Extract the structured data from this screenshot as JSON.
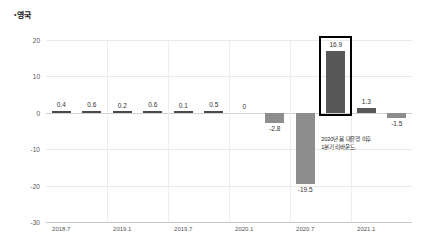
{
  "title": {
    "bullet": "•",
    "text": "영국"
  },
  "chart_data": {
    "type": "bar",
    "title": "영국",
    "xlabel": "",
    "ylabel": "",
    "ylim": [
      -30,
      20
    ],
    "grid": true,
    "legend": null,
    "categories": [
      "2018.7",
      "2018.10",
      "2019.1",
      "2019.4",
      "2019.7",
      "2019.10",
      "2020.1",
      "2020.4",
      "2020.7",
      "2020.10",
      "2021.1",
      "2021.4"
    ],
    "values": [
      0.4,
      0.6,
      0.2,
      0.6,
      0.1,
      0.5,
      0,
      -2.8,
      -19.5,
      16.9,
      1.3,
      -1.5
    ],
    "value_labels": [
      "0.4",
      "0.6",
      "0.2",
      "0.6",
      "0.1",
      "0.5",
      "0",
      "-2.8",
      "-19.5",
      "16.9",
      "1.3",
      "-1.5"
    ],
    "yticks": [
      20,
      10,
      0,
      -10,
      -20,
      -30
    ],
    "ytick_labels": [
      "20",
      "10",
      "0",
      "-10",
      "-20",
      "-30"
    ],
    "xtick_labels": [
      "2018.7",
      "2019.1",
      "2019.7",
      "2020.1",
      "2020.7",
      "2021.1"
    ],
    "xtick_indices": [
      0,
      2,
      4,
      6,
      8,
      10
    ],
    "highlighted_index": 9,
    "annotation": {
      "line1": "2020년 봄 대유행 이후",
      "line2": "1분기 리바운드."
    },
    "colors": {
      "bar": "#8d8d8d",
      "bar_dark": "#585858",
      "highlight_border": "#000000",
      "grid": "#e9e9e9",
      "text": "#333333"
    }
  }
}
